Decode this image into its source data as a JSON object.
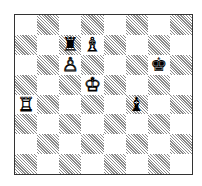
{
  "board": {
    "orientation": "white-bottom",
    "files": [
      "a",
      "b",
      "c",
      "d",
      "e",
      "f",
      "g",
      "h"
    ],
    "ranks": [
      8,
      7,
      6,
      5,
      4,
      3,
      2,
      1
    ],
    "pieces": [
      {
        "square": "c7",
        "color": "b",
        "type": "rook",
        "glyph": "♜"
      },
      {
        "square": "d7",
        "color": "w",
        "type": "bishop",
        "glyph": "♗"
      },
      {
        "square": "c6",
        "color": "w",
        "type": "pawn",
        "glyph": "♙"
      },
      {
        "square": "g6",
        "color": "b",
        "type": "king",
        "glyph": "♚"
      },
      {
        "square": "d5",
        "color": "w",
        "type": "king",
        "glyph": "♔"
      },
      {
        "square": "a4",
        "color": "w",
        "type": "rook",
        "glyph": "♖"
      },
      {
        "square": "f4",
        "color": "b",
        "type": "bishop",
        "glyph": "♝"
      }
    ]
  }
}
